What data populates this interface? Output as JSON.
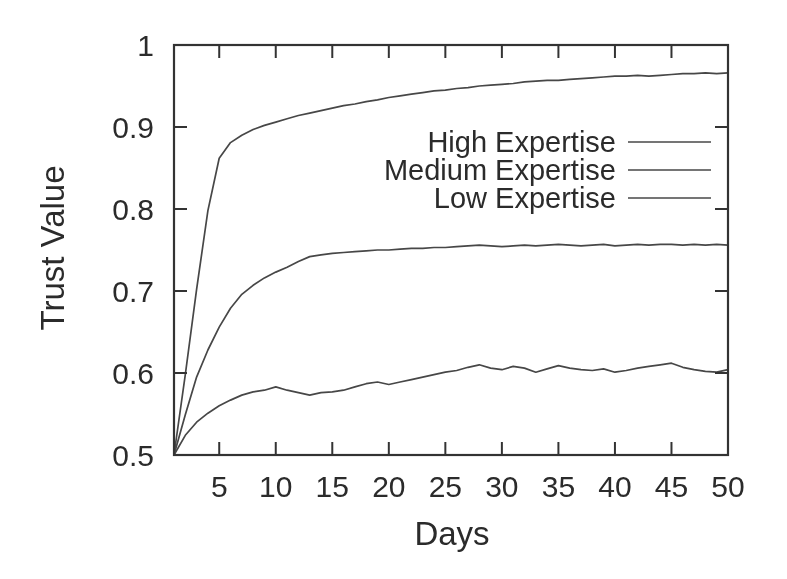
{
  "figure": {
    "background": "#ffffff",
    "line_color": "#474747",
    "border_color": "#333333",
    "text_color": "#2b2b2b"
  },
  "chart_data": {
    "type": "line",
    "title": "",
    "xlabel": "Days",
    "ylabel": "Trust Value",
    "xlim": [
      1,
      50
    ],
    "ylim": [
      0.5,
      1.0
    ],
    "grid": false,
    "legend_position": "top-right-inside",
    "xticks": [
      5,
      10,
      15,
      20,
      25,
      30,
      35,
      40,
      45,
      50
    ],
    "yticks": [
      {
        "value": 1.0,
        "label": "1"
      },
      {
        "value": 0.9,
        "label": "0.9"
      },
      {
        "value": 0.8,
        "label": "0.8"
      },
      {
        "value": 0.7,
        "label": "0.7"
      },
      {
        "value": 0.6,
        "label": "0.6"
      },
      {
        "value": 0.5,
        "label": "0.5"
      }
    ],
    "x": [
      1,
      2,
      3,
      4,
      5,
      6,
      7,
      8,
      9,
      10,
      11,
      12,
      13,
      14,
      15,
      16,
      17,
      18,
      19,
      20,
      21,
      22,
      23,
      24,
      25,
      26,
      27,
      28,
      29,
      30,
      31,
      32,
      33,
      34,
      35,
      36,
      37,
      38,
      39,
      40,
      41,
      42,
      43,
      44,
      45,
      46,
      47,
      48,
      49,
      50
    ],
    "series": [
      {
        "name": "High Expertise",
        "values": [
          0.5,
          0.598,
          0.702,
          0.798,
          0.862,
          0.881,
          0.89,
          0.897,
          0.902,
          0.906,
          0.91,
          0.914,
          0.917,
          0.92,
          0.923,
          0.926,
          0.928,
          0.931,
          0.933,
          0.936,
          0.938,
          0.94,
          0.942,
          0.944,
          0.945,
          0.947,
          0.948,
          0.95,
          0.951,
          0.952,
          0.953,
          0.955,
          0.956,
          0.957,
          0.957,
          0.958,
          0.959,
          0.96,
          0.961,
          0.962,
          0.962,
          0.963,
          0.962,
          0.963,
          0.964,
          0.965,
          0.965,
          0.966,
          0.965,
          0.966
        ]
      },
      {
        "name": "Medium Expertise",
        "values": [
          0.5,
          0.549,
          0.595,
          0.628,
          0.656,
          0.679,
          0.696,
          0.707,
          0.716,
          0.723,
          0.729,
          0.736,
          0.742,
          0.744,
          0.746,
          0.747,
          0.748,
          0.749,
          0.75,
          0.75,
          0.751,
          0.752,
          0.752,
          0.753,
          0.753,
          0.754,
          0.755,
          0.756,
          0.755,
          0.754,
          0.755,
          0.756,
          0.755,
          0.756,
          0.757,
          0.756,
          0.755,
          0.756,
          0.757,
          0.755,
          0.756,
          0.757,
          0.756,
          0.757,
          0.757,
          0.756,
          0.757,
          0.756,
          0.757,
          0.756
        ]
      },
      {
        "name": "Low Expertise",
        "values": [
          0.5,
          0.524,
          0.54,
          0.551,
          0.56,
          0.567,
          0.573,
          0.577,
          0.579,
          0.583,
          0.579,
          0.576,
          0.573,
          0.576,
          0.577,
          0.579,
          0.583,
          0.587,
          0.589,
          0.586,
          0.589,
          0.592,
          0.595,
          0.598,
          0.601,
          0.603,
          0.607,
          0.61,
          0.606,
          0.604,
          0.608,
          0.606,
          0.601,
          0.605,
          0.609,
          0.606,
          0.604,
          0.603,
          0.605,
          0.601,
          0.603,
          0.606,
          0.608,
          0.61,
          0.612,
          0.607,
          0.604,
          0.602,
          0.601,
          0.604
        ]
      }
    ]
  }
}
